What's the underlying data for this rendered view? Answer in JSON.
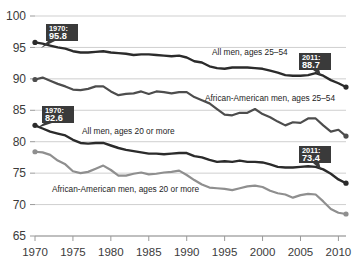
{
  "chart_data": {
    "type": "line",
    "title": "",
    "subtitle": "",
    "xlabel": "",
    "ylabel": "",
    "xlim": [
      1970,
      2011
    ],
    "ylim": [
      65,
      100
    ],
    "yticks": [
      65,
      70,
      75,
      80,
      85,
      90,
      95,
      100
    ],
    "xticks": [
      1970,
      1975,
      1980,
      1985,
      1990,
      1995,
      2000,
      2005,
      2010
    ],
    "grid": "horizontal",
    "legend": "inline-annotations",
    "x": [
      1970,
      1971,
      1972,
      1973,
      1974,
      1975,
      1976,
      1977,
      1978,
      1979,
      1980,
      1981,
      1982,
      1983,
      1984,
      1985,
      1986,
      1987,
      1988,
      1989,
      1990,
      1991,
      1992,
      1993,
      1994,
      1995,
      1996,
      1997,
      1998,
      1999,
      2000,
      2001,
      2002,
      2003,
      2004,
      2005,
      2006,
      2007,
      2008,
      2009,
      2010,
      2011
    ],
    "series": [
      {
        "name": "All men, ages 25-54",
        "color": "#2b2b2b",
        "width": 2.4,
        "start_marker": true,
        "end_marker": true,
        "values": [
          95.8,
          95.6,
          95.3,
          95.0,
          94.8,
          94.4,
          94.2,
          94.2,
          94.3,
          94.4,
          94.2,
          94.1,
          94.0,
          93.8,
          93.9,
          93.9,
          93.8,
          93.7,
          93.6,
          93.7,
          93.4,
          92.8,
          92.6,
          92.0,
          91.7,
          91.6,
          91.8,
          91.8,
          91.8,
          91.7,
          91.6,
          91.3,
          91.0,
          90.6,
          90.5,
          90.5,
          90.6,
          90.9,
          90.5,
          89.8,
          89.3,
          88.7
        ]
      },
      {
        "name": "African-American men, ages 25-54",
        "color": "#4d4d4d",
        "width": 2.2,
        "start_marker": true,
        "end_marker": true,
        "values": [
          89.9,
          90.2,
          89.7,
          89.2,
          88.8,
          88.3,
          88.2,
          88.4,
          88.8,
          88.8,
          88.0,
          87.4,
          87.6,
          87.7,
          88.0,
          87.6,
          88.0,
          87.9,
          87.7,
          87.9,
          87.9,
          87.1,
          86.6,
          86.1,
          85.2,
          84.3,
          84.2,
          84.6,
          84.6,
          85.2,
          84.4,
          83.9,
          83.2,
          82.6,
          83.1,
          83.0,
          83.7,
          83.7,
          82.6,
          81.6,
          81.9,
          80.9
        ]
      },
      {
        "name": "All men, ages 20 or more",
        "color": "#2b2b2b",
        "width": 2.4,
        "start_marker": true,
        "end_marker": true,
        "values": [
          82.6,
          82.1,
          81.6,
          81.3,
          81.0,
          80.3,
          79.8,
          79.7,
          79.8,
          79.8,
          79.4,
          79.0,
          78.7,
          78.5,
          78.3,
          78.1,
          78.1,
          78.0,
          78.1,
          78.2,
          78.2,
          77.7,
          77.5,
          77.1,
          76.8,
          76.9,
          76.8,
          77.0,
          76.8,
          76.8,
          76.7,
          76.4,
          76.0,
          75.9,
          75.9,
          76.0,
          76.1,
          76.0,
          75.6,
          74.9,
          74.0,
          73.4
        ]
      },
      {
        "name": "African-American men, ages 20 or more",
        "color": "#8f8f8f",
        "width": 2.2,
        "start_marker": true,
        "end_marker": true,
        "values": [
          78.4,
          78.3,
          77.9,
          77.0,
          76.4,
          75.3,
          75.0,
          75.2,
          75.7,
          76.2,
          75.5,
          74.6,
          74.6,
          74.9,
          75.1,
          74.8,
          74.9,
          75.1,
          75.2,
          75.4,
          74.7,
          73.9,
          73.2,
          72.7,
          72.6,
          72.5,
          72.3,
          72.6,
          72.9,
          73.0,
          72.8,
          72.2,
          71.8,
          71.6,
          71.1,
          71.5,
          71.7,
          71.6,
          70.5,
          69.3,
          68.7,
          68.5
        ]
      }
    ],
    "annotations": [
      {
        "name": "all-men-2554-start",
        "year_label": "1970:",
        "value_label": "95.8",
        "x": 1970,
        "y": 95.8
      },
      {
        "name": "all-men-2554-end",
        "year_label": "2011:",
        "value_label": "88.7",
        "x": 2011,
        "y": 88.7
      },
      {
        "name": "all-men-20plus-start",
        "year_label": "1970:",
        "value_label": "82.6",
        "x": 1970,
        "y": 82.6
      },
      {
        "name": "all-men-20plus-end",
        "year_label": "2011:",
        "value_label": "73.4",
        "x": 2011,
        "y": 73.4
      }
    ],
    "series_labels": [
      {
        "name": "label-all-men-2554",
        "text": "All men, ages 25–54"
      },
      {
        "name": "label-aa-men-2554",
        "text": "African-American men, ages 25–54"
      },
      {
        "name": "label-all-men-20plus",
        "text": "All men, ages 20 or more"
      },
      {
        "name": "label-aa-men-20plus",
        "text": "African-American men, ages 20 or more"
      }
    ],
    "colors": {
      "gridline": "#c9c9c9",
      "axis": "#9a9a9a",
      "tick_text": "#3b3b3b",
      "callout_bg": "#3a3a3a",
      "callout_text": "#ffffff",
      "background": "#ffffff"
    }
  }
}
